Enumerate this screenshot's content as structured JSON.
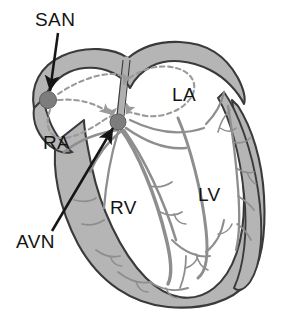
{
  "figure": {
    "kind": "anatomical-diagram",
    "background_color": "#ffffff",
    "view": "frontal coronal cross-section"
  },
  "palette": {
    "outline": "#3a3a3a",
    "wall_fill": "#b5b5b5",
    "chamber_fill": "#ffffff",
    "node_fill": "#7d7d7d",
    "node_stroke": "#5e5e5e",
    "fiber": "#8e8e8e",
    "dashed_path": "#9a9a9a",
    "arrow": "#151515",
    "label_text": "#141414"
  },
  "labels": [
    {
      "id": "san",
      "text": "SAN",
      "x": 35,
      "y": 10,
      "chamber": "sinoatrial node"
    },
    {
      "id": "la",
      "text": "LA",
      "x": 172,
      "y": 85,
      "chamber": "left atrium"
    },
    {
      "id": "ra",
      "text": "RA",
      "x": 43,
      "y": 133,
      "chamber": "right atrium"
    },
    {
      "id": "lv",
      "text": "LV",
      "x": 198,
      "y": 185,
      "chamber": "left ventricle"
    },
    {
      "id": "rv",
      "text": "RV",
      "x": 110,
      "y": 198,
      "chamber": "right ventricle"
    },
    {
      "id": "avn",
      "text": "AVN",
      "x": 16,
      "y": 232,
      "chamber": "atrioventricular node"
    }
  ],
  "nodes": [
    {
      "id": "san-node",
      "name": "sinoatrial-node",
      "cx": 48,
      "cy": 100,
      "r": 8.5
    },
    {
      "id": "avn-node",
      "name": "atrioventricular-node",
      "cx": 118,
      "cy": 122,
      "r": 8.0
    }
  ],
  "pointer_arrows": [
    {
      "id": "san-arrow",
      "from_label": "SAN",
      "to_node": "san-node",
      "x1": 58,
      "y1": 33,
      "x2": 50,
      "y2": 91
    },
    {
      "id": "avn-arrow",
      "from_label": "AVN",
      "to_node": "avn-node",
      "x1": 52,
      "y1": 231,
      "x2": 113,
      "y2": 128
    }
  ],
  "conduction_paths": {
    "style": "dashed",
    "description": "internodal atrial conduction pathways radiating from SAN and converging on AVN",
    "count": 4
  },
  "structures": [
    {
      "name": "right-atrium-wall"
    },
    {
      "name": "left-atrium-wall"
    },
    {
      "name": "right-ventricle-wall"
    },
    {
      "name": "left-ventricle-wall"
    },
    {
      "name": "interventricular-septum"
    },
    {
      "name": "tricuspid-valve-plane"
    },
    {
      "name": "mitral-valve-plane"
    },
    {
      "name": "purkinje-fiber-network"
    }
  ]
}
